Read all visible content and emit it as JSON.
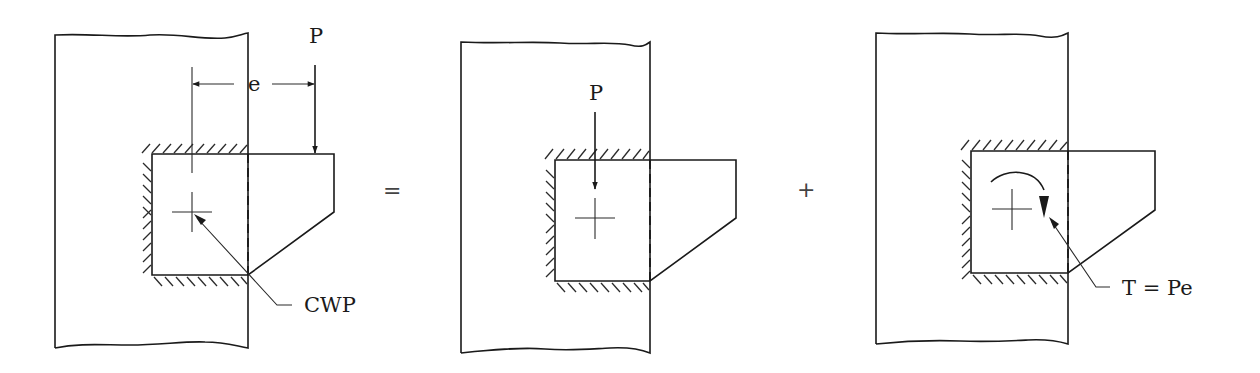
{
  "diagram": {
    "colors": {
      "line": "#1a1a1a",
      "background": "#ffffff"
    },
    "operators": {
      "equals": "=",
      "plus": "+"
    },
    "panels": [
      {
        "id": "eccentric",
        "labels": {
          "load": "P",
          "eccentricity": "e",
          "weld_centroid": "CWP"
        }
      },
      {
        "id": "direct-shear",
        "labels": {
          "load": "P"
        }
      },
      {
        "id": "torsion",
        "labels": {
          "torque": "T = Pe"
        }
      }
    ]
  }
}
